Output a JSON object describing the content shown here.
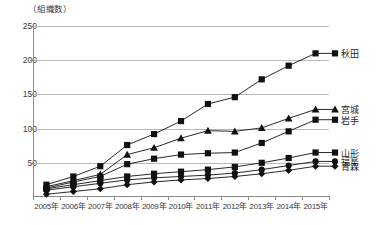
{
  "chart_data": {
    "type": "line",
    "title": "",
    "unit_label": "（組織数）",
    "xlabel": "",
    "ylabel": "",
    "ylim": [
      0,
      250
    ],
    "yticks": [
      250,
      200,
      150,
      100,
      50
    ],
    "grid": true,
    "legend_position": "right-inline",
    "categories": [
      "2005年",
      "2006年",
      "2007年",
      "2008年",
      "2009年",
      "2010年",
      "2011年",
      "2012年",
      "2013年",
      "2014年",
      "2015年"
    ],
    "series": [
      {
        "name": "秋田",
        "marker": "square",
        "values": [
          18,
          30,
          45,
          76,
          92,
          111,
          136,
          146,
          172,
          192,
          210
        ]
      },
      {
        "name": "宮城",
        "marker": "triangle",
        "values": [
          15,
          24,
          33,
          62,
          72,
          86,
          97,
          96,
          101,
          115,
          128
        ]
      },
      {
        "name": "岩手",
        "marker": "square",
        "values": [
          13,
          22,
          30,
          48,
          56,
          62,
          64,
          65,
          79,
          96,
          113
        ]
      },
      {
        "name": "山形",
        "marker": "square",
        "values": [
          12,
          18,
          24,
          30,
          34,
          37,
          40,
          44,
          50,
          57,
          65
        ]
      },
      {
        "name": "福島",
        "marker": "circle",
        "values": [
          10,
          15,
          20,
          25,
          28,
          30,
          32,
          35,
          40,
          46,
          52
        ]
      },
      {
        "name": "青森",
        "marker": "diamond",
        "values": [
          4,
          8,
          12,
          18,
          22,
          25,
          27,
          30,
          34,
          39,
          45
        ]
      }
    ]
  },
  "axis": {
    "ytick_0": "250",
    "ytick_1": "200",
    "ytick_2": "150",
    "ytick_3": "100",
    "ytick_4": "50"
  }
}
